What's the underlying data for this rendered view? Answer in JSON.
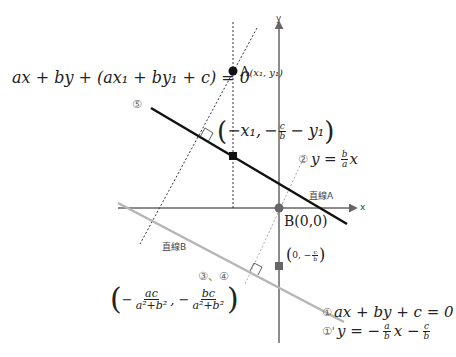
{
  "diagram": {
    "axes": {
      "x_label": "x",
      "y_label": "y"
    },
    "points": {
      "A": {
        "name": "A",
        "coords": "(x₁, y₁)"
      },
      "B": {
        "label": "B(0,0)"
      }
    },
    "lines": {
      "line_a_label": "直線A",
      "line_b_label": "直線B"
    },
    "equations": {
      "eq6_label": "ax + by + (ax₁ + by₁ + c) = 0",
      "marker6": "⑤",
      "foot_point": {
        "x": "−x₁,",
        "y_num": "c",
        "y_den": "b",
        "y_prefix": "−",
        "y_suffix": "− y₁"
      },
      "eq2": {
        "marker": "②",
        "lhs": "y =",
        "num": "b",
        "den": "a",
        "rhs": "x"
      },
      "intercept": {
        "prefix": "0, −",
        "num": "c",
        "den": "b"
      },
      "markers34": "③、④",
      "foot_b": {
        "x_num": "ac",
        "x_den": "a²+b²",
        "y_num": "bc",
        "y_den": "a²+b²"
      },
      "eq1": {
        "marker": "①",
        "text": "ax + by + c = 0"
      },
      "eq1p": {
        "marker": "①'",
        "lhs": "y = −",
        "num1": "a",
        "den1": "b",
        "mid": "x −",
        "num2": "c",
        "den2": "b"
      }
    },
    "colors": {
      "line6": "#111111",
      "line1": "#b5b5b5",
      "axis": "#666666",
      "dotted": "#333333",
      "line2": "#aaaaaa"
    }
  }
}
